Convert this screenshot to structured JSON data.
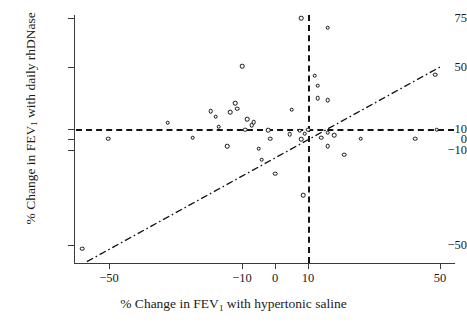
{
  "chart_data": {
    "type": "scatter",
    "title": "",
    "xlabel": "% Change in FEV1 with hypertonic saline",
    "ylabel": "% Change in FEV1 with daily rhDNase",
    "xlabel_parts": {
      "pre": "% Change in FEV",
      "sub": "1",
      "post": " with hypertonic saline"
    },
    "ylabel_parts": {
      "pre": "% Change in FEV",
      "sub": "1",
      "post": " with daily rhDNase"
    },
    "xtick_labels": [
      "−50",
      "−10",
      "0",
      "10",
      "50"
    ],
    "xtick_values": [
      -50,
      -10,
      0,
      10,
      50
    ],
    "ytick_labels": [
      "75",
      "50",
      "10",
      "0",
      "−10",
      "−50"
    ],
    "ytick_values": [
      75,
      50,
      10,
      0,
      -10,
      -50
    ],
    "xlim": [
      -62,
      55
    ],
    "ylim": [
      -62,
      80
    ],
    "grid": false,
    "legend": null,
    "axis_note": "y-axis is broken/compressed above 50 and below -10",
    "reference_lines": [
      {
        "name": "horizontal-threshold",
        "orientation": "horizontal",
        "value": 10,
        "style": "dashed"
      },
      {
        "name": "vertical-threshold",
        "orientation": "vertical",
        "value": 10,
        "style": "dashed"
      }
    ],
    "fit_line": {
      "name": "line-of-identity",
      "style": "dash-dot",
      "x_start": -57,
      "y_start": -57,
      "x_end": 50,
      "y_end": 50
    },
    "points": [
      {
        "x": -50.5,
        "y": 0.5
      },
      {
        "x": -32.5,
        "y": 14.0
      },
      {
        "x": -25.0,
        "y": 1.5
      },
      {
        "x": -19.5,
        "y": 21.5
      },
      {
        "x": -18.0,
        "y": 18.0
      },
      {
        "x": -17.0,
        "y": 11.5
      },
      {
        "x": -14.5,
        "y": -6.5
      },
      {
        "x": -13.5,
        "y": 21.0
      },
      {
        "x": -12.0,
        "y": 26.5
      },
      {
        "x": -11.5,
        "y": 23.0
      },
      {
        "x": -10.0,
        "y": 50.5
      },
      {
        "x": -9.0,
        "y": 9.5
      },
      {
        "x": -8.5,
        "y": 16.5
      },
      {
        "x": -7.0,
        "y": 12.5
      },
      {
        "x": -6.5,
        "y": 14.5
      },
      {
        "x": -5.0,
        "y": -9.0
      },
      {
        "x": -4.0,
        "y": -14.0
      },
      {
        "x": -2.0,
        "y": 9.0
      },
      {
        "x": -1.5,
        "y": 0.5
      },
      {
        "x": 0.0,
        "y": -20.0
      },
      {
        "x": 4.5,
        "y": 5.0
      },
      {
        "x": 5.0,
        "y": 22.5
      },
      {
        "x": 7.5,
        "y": 8.5
      },
      {
        "x": 8.0,
        "y": 0.0
      },
      {
        "x": 8.0,
        "y": 75.0
      },
      {
        "x": 8.5,
        "y": -29.0
      },
      {
        "x": 9.0,
        "y": 5.5
      },
      {
        "x": 10.0,
        "y": 9.5
      },
      {
        "x": 12.0,
        "y": 44.5
      },
      {
        "x": 13.0,
        "y": 38.0
      },
      {
        "x": 13.0,
        "y": 30.0
      },
      {
        "x": 14.0,
        "y": 1.5
      },
      {
        "x": 16.0,
        "y": 28.5
      },
      {
        "x": 16.0,
        "y": 70.0
      },
      {
        "x": 16.0,
        "y": 6.5
      },
      {
        "x": 16.0,
        "y": -6.5
      },
      {
        "x": 18.0,
        "y": 4.0
      },
      {
        "x": 21.0,
        "y": -12.0
      },
      {
        "x": 26.0,
        "y": 0.5
      },
      {
        "x": 42.5,
        "y": 0.5
      },
      {
        "x": 48.5,
        "y": 45.0
      },
      {
        "x": 49.0,
        "y": 9.5
      },
      {
        "x": -58.5,
        "y": -51.5
      }
    ]
  },
  "colors": {
    "axis": "#3a3a3a",
    "point_stroke": "#101010",
    "reference_line": "#141414",
    "fit_line": "#101010",
    "background": "#ffffff",
    "text": "#1a1a1a"
  }
}
